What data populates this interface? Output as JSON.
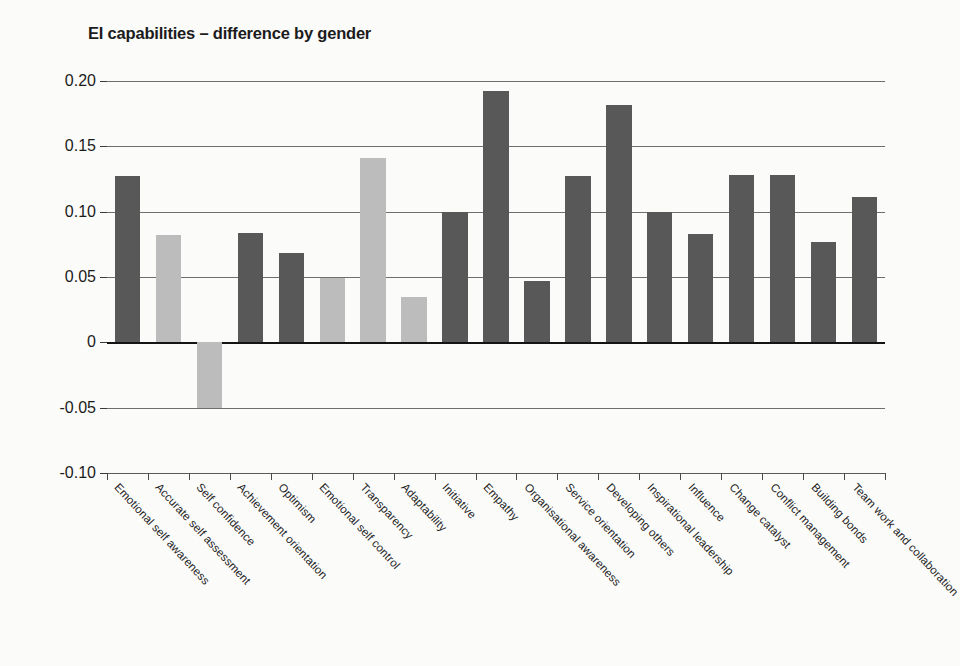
{
  "chart_data": {
    "type": "bar",
    "title": "EI capabilities – difference by gender",
    "xlabel": "",
    "ylabel": "",
    "ylim": [
      -0.1,
      0.2
    ],
    "grid": true,
    "legend": "none",
    "ytick_labels": [
      "0.20",
      "0.15",
      "0.10",
      "0.05",
      "0",
      "-0.05",
      "-0.10"
    ],
    "ytick_values": [
      0.2,
      0.15,
      0.1,
      0.05,
      0,
      -0.05,
      -0.1
    ],
    "colors": {
      "dark_bar": "#585858",
      "light_bar": "#bcbcbc",
      "axis": "#141414",
      "gridline": "#6e6e6e",
      "background": "#fbfbfa",
      "text": "#1c1c1c"
    },
    "categories": [
      "Emotional self awareness",
      "Accurate self assessment",
      "Self confidence",
      "Achievement orientation",
      "Optimism",
      "Emotional self control",
      "Transparency",
      "Adaptability",
      "Initiative",
      "Empathy",
      "Organisational awareness",
      "Service orientation",
      "Developing others",
      "Inspirational leadership",
      "Influence",
      "Change catalyst",
      "Conflict management",
      "Building bonds",
      "Team work and collaboration"
    ],
    "values": [
      0.127,
      0.082,
      -0.05,
      0.084,
      0.068,
      0.049,
      0.141,
      0.035,
      0.1,
      0.192,
      0.047,
      0.127,
      0.182,
      0.1,
      0.083,
      0.128,
      0.128,
      0.077,
      0.111
    ],
    "bar_shades": [
      "dark",
      "light",
      "light",
      "dark",
      "dark",
      "light",
      "light",
      "light",
      "dark",
      "dark",
      "dark",
      "dark",
      "dark",
      "dark",
      "dark",
      "dark",
      "dark",
      "dark",
      "dark"
    ]
  }
}
